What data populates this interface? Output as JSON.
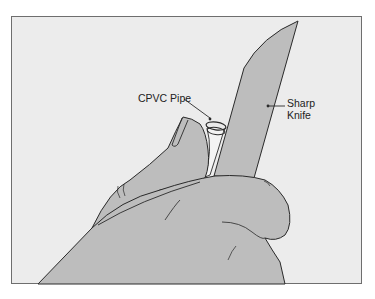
{
  "figure": {
    "type": "illustration",
    "labels": [
      {
        "id": "cpvc-pipe",
        "text": "CPVC Pipe"
      },
      {
        "id": "sharp-knife",
        "line1": "Sharp",
        "line2": "Knife"
      }
    ],
    "colors": {
      "background": "#ececec",
      "fill": "#bdbdbd",
      "stroke": "#2a2a2a",
      "pipe": "#f4f4f4"
    }
  }
}
